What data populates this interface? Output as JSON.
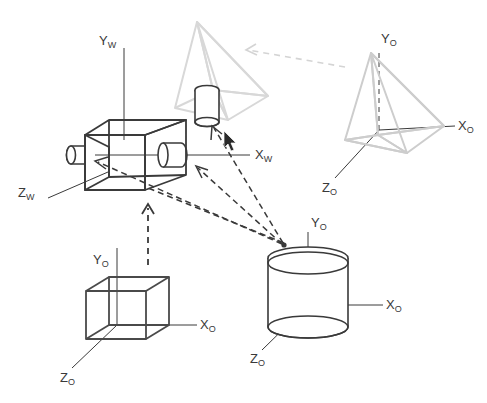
{
  "figure": {
    "background_color": "#ffffff",
    "ink_dark": "#3a3a3a",
    "ink_mid": "#6f6f6f",
    "ink_light": "#cfcfcf",
    "ink_lighter": "#dddddd"
  },
  "labels": {
    "world": {
      "y": {
        "base": "Y",
        "sub": "W"
      },
      "x": {
        "base": "X",
        "sub": "W"
      },
      "z": {
        "base": "Z",
        "sub": "W"
      }
    },
    "object_pyramid": {
      "y": {
        "base": "Y",
        "sub": "O"
      },
      "x": {
        "base": "X",
        "sub": "O"
      },
      "z": {
        "base": "Z",
        "sub": "O"
      }
    },
    "object_cylinder": {
      "y": {
        "base": "Y",
        "sub": "O"
      },
      "x": {
        "base": "X",
        "sub": "O"
      },
      "z": {
        "base": "Z",
        "sub": "O"
      }
    },
    "object_cube": {
      "y": {
        "base": "Y",
        "sub": "O"
      },
      "x": {
        "base": "X",
        "sub": "O"
      },
      "z": {
        "base": "Z",
        "sub": "O"
      }
    }
  },
  "objects": [
    {
      "name": "camera",
      "frame": "world",
      "description": "camera body box with two lens barrels"
    },
    {
      "name": "pyramid",
      "frame": "object",
      "description": "tetrahedral pyramid, top right"
    },
    {
      "name": "cylinder",
      "frame": "object",
      "description": "upright cylinder, bottom right"
    },
    {
      "name": "cube",
      "frame": "object",
      "description": "wireframe cube, bottom left"
    },
    {
      "name": "projected-pyramid",
      "frame": "image",
      "description": "faint pyramid projected near camera"
    },
    {
      "name": "projected-cylinder",
      "frame": "image",
      "description": "small cylinder projected near camera"
    }
  ],
  "connectors": [
    {
      "name": "cylinder-to-camera-front",
      "style": "dashed",
      "color": "#3a3a3a"
    },
    {
      "name": "cylinder-to-camera-side",
      "style": "dashed",
      "color": "#3a3a3a"
    },
    {
      "name": "cylinder-to-projected-cylinder",
      "style": "dashed",
      "color": "#3a3a3a"
    },
    {
      "name": "cube-to-camera",
      "style": "dashed",
      "color": "#3a3a3a"
    },
    {
      "name": "pyramid-to-projected-pyramid",
      "style": "dashed",
      "color": "#cfcfcf"
    }
  ]
}
